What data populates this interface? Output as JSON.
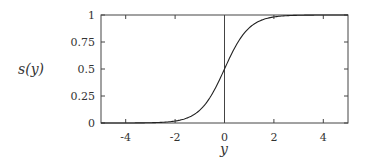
{
  "chart_data": {
    "type": "line",
    "title": "",
    "xlabel": "y",
    "ylabel": "s(y)",
    "xlim": [
      -5,
      5
    ],
    "ylim": [
      0,
      1
    ],
    "xticks": [
      -4,
      -2,
      0,
      2,
      4
    ],
    "xtick_labels": [
      "-4",
      "-2",
      "0",
      "2",
      "4"
    ],
    "yticks": [
      0,
      0.25,
      0.5,
      0.75,
      1
    ],
    "ytick_labels": [
      "0",
      "0.25",
      "0.5",
      "0.75",
      "1"
    ],
    "grid": false,
    "legend": null,
    "annotations": [
      {
        "type": "vline",
        "x": 0
      }
    ],
    "series": [
      {
        "name": "s(y) = 1/(1+e^(-2y))",
        "x": [
          -5,
          -4,
          -3,
          -2,
          -1.5,
          -1,
          -0.5,
          0,
          0.5,
          1,
          1.5,
          2,
          3,
          4,
          5
        ],
        "y": [
          4.54e-05,
          0.000335,
          0.00247,
          0.018,
          0.047,
          0.119,
          0.269,
          0.5,
          0.731,
          0.881,
          0.953,
          0.982,
          0.9975,
          0.9997,
          1.0
        ]
      }
    ]
  },
  "labels": {
    "ylabel_text": "s(y)",
    "xlabel_text": "y"
  }
}
